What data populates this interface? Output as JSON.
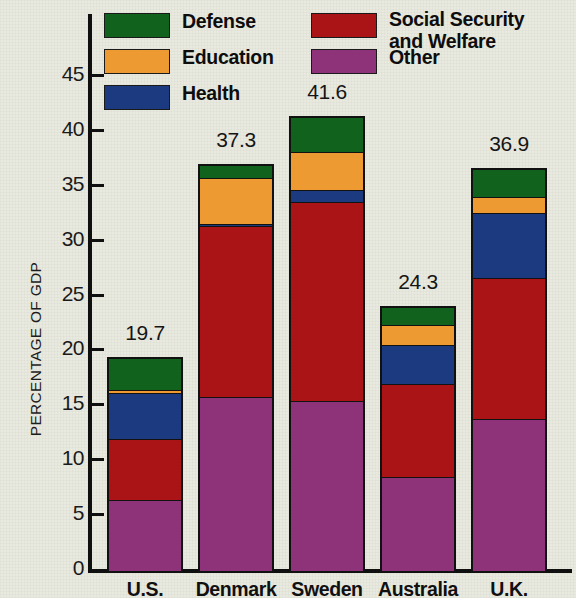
{
  "chart_data": {
    "type": "bar",
    "subtype": "stacked-bar",
    "title": "",
    "xlabel": "",
    "ylabel": "PERCENTAGE OF GDP",
    "ylim": [
      0,
      47.5
    ],
    "ytick_values": [
      0,
      5,
      10,
      15,
      20,
      25,
      30,
      35,
      40,
      45
    ],
    "ytick_labels": [
      "0",
      "5",
      "10",
      "15",
      "20",
      "25",
      "30",
      "35",
      "40",
      "45"
    ],
    "grid": false,
    "legend_position": "top-inside",
    "categories": [
      "U.S.",
      "Denmark",
      "Sweden",
      "Australia",
      "U.K."
    ],
    "totals": [
      19.7,
      37.3,
      41.6,
      24.3,
      36.9
    ],
    "total_labels": [
      "19.7",
      "37.3",
      "41.6",
      "24.3",
      "36.9"
    ],
    "stack_order_bottom_to_top": [
      "Other",
      "Social Security and Welfare",
      "Health",
      "Education",
      "Defense"
    ],
    "series": [
      {
        "name": "Other",
        "color": "#8e3279",
        "values": [
          6.5,
          15.9,
          15.5,
          8.6,
          13.9
        ]
      },
      {
        "name": "Social Security and Welfare",
        "color": "#ab1417",
        "values": [
          5.7,
          15.7,
          18.3,
          8.6,
          13.0
        ]
      },
      {
        "name": "Health",
        "color": "#1c3a80",
        "values": [
          4.2,
          0.2,
          1.1,
          3.6,
          5.9
        ]
      },
      {
        "name": "Education",
        "color": "#ee9a33",
        "values": [
          0.3,
          4.3,
          3.5,
          1.9,
          1.5
        ]
      },
      {
        "name": "Defense",
        "color": "#11621d",
        "values": [
          3.0,
          1.2,
          3.2,
          1.6,
          2.6
        ]
      }
    ]
  },
  "legend": {
    "left_column": [
      {
        "key": "defense",
        "label": "Defense",
        "color": "#11621d"
      },
      {
        "key": "education",
        "label": "Education",
        "color": "#ee9a33"
      },
      {
        "key": "health",
        "label": "Health",
        "color": "#1c3a80"
      }
    ],
    "right_column": [
      {
        "key": "social",
        "label": "Social Security\nand Welfare",
        "color": "#ab1417"
      },
      {
        "key": "other",
        "label": "Other",
        "color": "#8e3279"
      }
    ]
  },
  "axis": {
    "y_title": "PERCENTAGE OF GDP"
  }
}
